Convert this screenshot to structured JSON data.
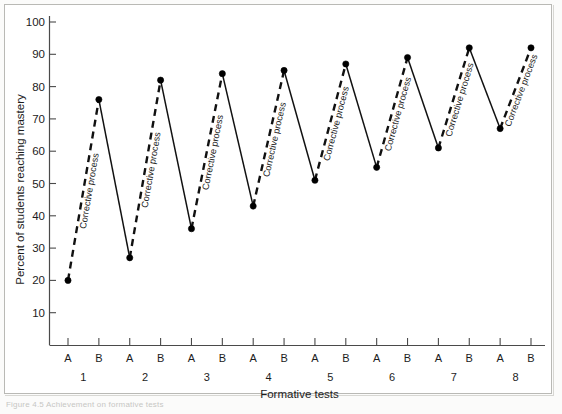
{
  "figure": {
    "caption": "Figure 4.5   Achievement on formative tests"
  },
  "chart_data": {
    "type": "line",
    "title": "",
    "xlabel": "Formative tests",
    "ylabel": "Percent of students reaching mastery",
    "ylim": [
      0,
      100
    ],
    "yticks": [
      10,
      20,
      30,
      40,
      50,
      60,
      70,
      80,
      90,
      100
    ],
    "grid": false,
    "legend": null,
    "x_group_labels": [
      "1",
      "2",
      "3",
      "4",
      "5",
      "6",
      "7",
      "8"
    ],
    "x_point_labels": [
      "A",
      "B",
      "A",
      "B",
      "A",
      "B",
      "A",
      "B",
      "A",
      "B",
      "A",
      "B",
      "A",
      "B",
      "A",
      "B"
    ],
    "categories": [
      "1A",
      "1B",
      "2A",
      "2B",
      "3A",
      "3B",
      "4A",
      "4B",
      "5A",
      "5B",
      "6A",
      "6B",
      "7A",
      "7B",
      "8A",
      "8B"
    ],
    "values": [
      20,
      76,
      27,
      82,
      36,
      84,
      43,
      85,
      51,
      87,
      55,
      89,
      61,
      92,
      67,
      92
    ],
    "segments": [
      {
        "from": "1A",
        "to": "1B",
        "style": "dashed",
        "annotation": "Corrective process"
      },
      {
        "from": "1B",
        "to": "2A",
        "style": "solid",
        "annotation": ""
      },
      {
        "from": "2A",
        "to": "2B",
        "style": "dashed",
        "annotation": "Corrective process"
      },
      {
        "from": "2B",
        "to": "3A",
        "style": "solid",
        "annotation": ""
      },
      {
        "from": "3A",
        "to": "3B",
        "style": "dashed",
        "annotation": "Corrective process"
      },
      {
        "from": "3B",
        "to": "4A",
        "style": "solid",
        "annotation": ""
      },
      {
        "from": "4A",
        "to": "4B",
        "style": "dashed",
        "annotation": "Corrective process"
      },
      {
        "from": "4B",
        "to": "5A",
        "style": "solid",
        "annotation": ""
      },
      {
        "from": "5A",
        "to": "5B",
        "style": "dashed",
        "annotation": "Corrective process"
      },
      {
        "from": "5B",
        "to": "6A",
        "style": "solid",
        "annotation": ""
      },
      {
        "from": "6A",
        "to": "6B",
        "style": "dashed",
        "annotation": "Corrective process"
      },
      {
        "from": "6B",
        "to": "7A",
        "style": "solid",
        "annotation": ""
      },
      {
        "from": "7A",
        "to": "7B",
        "style": "dashed",
        "annotation": "Corrective process"
      },
      {
        "from": "7B",
        "to": "8A",
        "style": "solid",
        "annotation": ""
      },
      {
        "from": "8A",
        "to": "8B",
        "style": "dashed",
        "annotation": "Corrective process"
      }
    ],
    "annotations": [
      "Corrective process",
      "Corrective process",
      "Corrective process",
      "Corrective process",
      "Corrective process",
      "Corrective process",
      "Corrective process",
      "Corrective process"
    ],
    "colors": {
      "line": "#111111",
      "marker": "#000000",
      "axis": "#4a4a4a",
      "background": "#ffffff"
    }
  }
}
